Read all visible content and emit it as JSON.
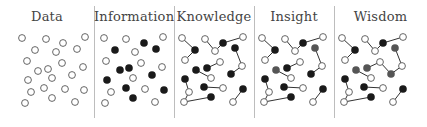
{
  "colors": {
    "open_fill": "#ffffff",
    "open_stroke": "#555555",
    "filled": "#1a1a1a",
    "highlight": "#555555",
    "edge": "#333333",
    "divider": "#bdbdbd",
    "title": "#444444"
  },
  "panels": [
    {
      "title": "Data",
      "x": 0,
      "width": 94,
      "nodes": [
        [
          22,
          38,
          "o"
        ],
        [
          46,
          39,
          "o"
        ],
        [
          85,
          37,
          "o"
        ],
        [
          63,
          43,
          "o"
        ],
        [
          35,
          50,
          "o"
        ],
        [
          56,
          52,
          "o"
        ],
        [
          77,
          49,
          "o"
        ],
        [
          27,
          61,
          "o"
        ],
        [
          62,
          63,
          "o"
        ],
        [
          83,
          67,
          "o"
        ],
        [
          38,
          71,
          "o"
        ],
        [
          48,
          69,
          "o"
        ],
        [
          72,
          75,
          "o"
        ],
        [
          52,
          78,
          "o"
        ],
        [
          28,
          80,
          "o"
        ],
        [
          44,
          88,
          "o"
        ],
        [
          65,
          89,
          "o"
        ],
        [
          84,
          90,
          "o"
        ],
        [
          31,
          92,
          "o"
        ],
        [
          52,
          98,
          "o"
        ],
        [
          25,
          103,
          "o"
        ],
        [
          75,
          102,
          "o"
        ]
      ],
      "edges": []
    },
    {
      "title": "Information",
      "x": 94,
      "width": 80,
      "nodes": [
        [
          104,
          38,
          "o"
        ],
        [
          126,
          39,
          "o"
        ],
        [
          144,
          43,
          "f"
        ],
        [
          163,
          37,
          "o"
        ],
        [
          115,
          50,
          "f"
        ],
        [
          135,
          52,
          "o"
        ],
        [
          156,
          49,
          "f"
        ],
        [
          106,
          61,
          "o"
        ],
        [
          141,
          63,
          "o"
        ],
        [
          162,
          67,
          "o"
        ],
        [
          120,
          70,
          "f"
        ],
        [
          129,
          68,
          "f"
        ],
        [
          152,
          75,
          "f"
        ],
        [
          133,
          78,
          "o"
        ],
        [
          107,
          80,
          "f"
        ],
        [
          126,
          88,
          "f"
        ],
        [
          145,
          89,
          "o"
        ],
        [
          164,
          90,
          "f"
        ],
        [
          111,
          92,
          "o"
        ],
        [
          133,
          98,
          "f"
        ],
        [
          105,
          103,
          "o"
        ],
        [
          155,
          102,
          "o"
        ]
      ],
      "edges": []
    },
    {
      "title": "Knowledge",
      "x": 174,
      "width": 80,
      "nodes": [
        [
          182,
          38,
          "o"
        ],
        [
          195,
          50,
          "f"
        ],
        [
          185,
          60,
          "o"
        ],
        [
          205,
          39,
          "o"
        ],
        [
          215,
          51,
          "o"
        ],
        [
          223,
          43,
          "f"
        ],
        [
          243,
          37,
          "o"
        ],
        [
          235,
          48,
          "f"
        ],
        [
          242,
          66,
          "o"
        ],
        [
          231,
          74,
          "f"
        ],
        [
          196,
          70,
          "f"
        ],
        [
          211,
          78,
          "o"
        ],
        [
          207,
          68,
          "f"
        ],
        [
          220,
          62,
          "o"
        ],
        [
          185,
          79,
          "f"
        ],
        [
          189,
          92,
          "o"
        ],
        [
          184,
          102,
          "o"
        ],
        [
          211,
          97,
          "f"
        ],
        [
          204,
          87,
          "f"
        ],
        [
          223,
          88,
          "o"
        ],
        [
          243,
          89,
          "f"
        ],
        [
          233,
          102,
          "o"
        ]
      ],
      "edges": [
        [
          0,
          1
        ],
        [
          1,
          2
        ],
        [
          3,
          4
        ],
        [
          4,
          5
        ],
        [
          5,
          6
        ],
        [
          7,
          8
        ],
        [
          8,
          9
        ],
        [
          10,
          11
        ],
        [
          12,
          13
        ],
        [
          14,
          15
        ],
        [
          15,
          16
        ],
        [
          16,
          17
        ],
        [
          18,
          19
        ],
        [
          20,
          21
        ]
      ]
    },
    {
      "title": "Insight",
      "x": 254,
      "width": 80,
      "nodes": [
        [
          262,
          38,
          "o"
        ],
        [
          275,
          50,
          "f"
        ],
        [
          265,
          60,
          "o"
        ],
        [
          285,
          39,
          "o"
        ],
        [
          295,
          51,
          "o"
        ],
        [
          303,
          43,
          "f"
        ],
        [
          323,
          37,
          "o"
        ],
        [
          315,
          48,
          "h"
        ],
        [
          322,
          66,
          "o"
        ],
        [
          311,
          74,
          "f"
        ],
        [
          276,
          70,
          "h"
        ],
        [
          291,
          78,
          "o"
        ],
        [
          287,
          68,
          "f"
        ],
        [
          300,
          62,
          "o"
        ],
        [
          265,
          79,
          "f"
        ],
        [
          269,
          92,
          "o"
        ],
        [
          264,
          102,
          "o"
        ],
        [
          291,
          97,
          "f"
        ],
        [
          284,
          87,
          "f"
        ],
        [
          303,
          88,
          "o"
        ],
        [
          323,
          89,
          "f"
        ],
        [
          313,
          102,
          "o"
        ]
      ],
      "edges": [
        [
          0,
          1
        ],
        [
          1,
          2
        ],
        [
          3,
          4
        ],
        [
          4,
          5
        ],
        [
          5,
          6
        ],
        [
          7,
          8
        ],
        [
          8,
          9
        ],
        [
          10,
          11
        ],
        [
          12,
          13
        ],
        [
          14,
          15
        ],
        [
          15,
          16
        ],
        [
          16,
          17
        ],
        [
          18,
          19
        ],
        [
          20,
          21
        ]
      ]
    },
    {
      "title": "Wisdom",
      "x": 334,
      "width": 93,
      "nodes": [
        [
          342,
          38,
          "o"
        ],
        [
          355,
          50,
          "f"
        ],
        [
          345,
          60,
          "o"
        ],
        [
          365,
          39,
          "o"
        ],
        [
          375,
          51,
          "o"
        ],
        [
          383,
          43,
          "f"
        ],
        [
          403,
          37,
          "o"
        ],
        [
          395,
          48,
          "h"
        ],
        [
          402,
          66,
          "o"
        ],
        [
          391,
          74,
          "h"
        ],
        [
          356,
          70,
          "h"
        ],
        [
          371,
          78,
          "o"
        ],
        [
          367,
          68,
          "h"
        ],
        [
          380,
          62,
          "o"
        ],
        [
          345,
          79,
          "f"
        ],
        [
          349,
          92,
          "o"
        ],
        [
          344,
          102,
          "o"
        ],
        [
          371,
          97,
          "f"
        ],
        [
          364,
          87,
          "f"
        ],
        [
          383,
          88,
          "o"
        ],
        [
          403,
          89,
          "f"
        ],
        [
          393,
          102,
          "o"
        ]
      ],
      "edges": [
        [
          0,
          1
        ],
        [
          1,
          2
        ],
        [
          3,
          4
        ],
        [
          4,
          5
        ],
        [
          5,
          6
        ],
        [
          7,
          8
        ],
        [
          8,
          9
        ],
        [
          10,
          11
        ],
        [
          12,
          13
        ],
        [
          13,
          9
        ],
        [
          14,
          15
        ],
        [
          15,
          16
        ],
        [
          16,
          17
        ],
        [
          18,
          19
        ],
        [
          20,
          21
        ]
      ]
    }
  ]
}
